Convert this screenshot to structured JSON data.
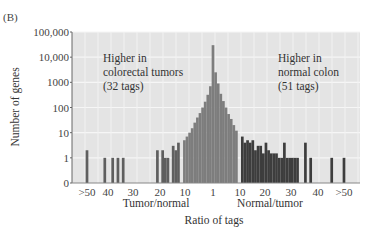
{
  "panel_label": "(B)",
  "chart_data": {
    "type": "bar",
    "title": "",
    "xlabel": "Ratio of tags",
    "ylabel": "Number of genes",
    "yscale": "log",
    "ylim": [
      0,
      100000
    ],
    "y_ticks": [
      {
        "value": 0,
        "label": "0"
      },
      {
        "value": 1,
        "label": "1"
      },
      {
        "value": 10,
        "label": "10"
      },
      {
        "value": 100,
        "label": "100"
      },
      {
        "value": 1000,
        "label": "1000"
      },
      {
        "value": 10000,
        "label": "10,000"
      },
      {
        "value": 100000,
        "label": "100,000"
      }
    ],
    "x_ticks": [
      ">50",
      "40",
      "30",
      "20",
      "10",
      "1",
      "10",
      "20",
      "30",
      "40",
      ">50"
    ],
    "x_group_labels": [
      {
        "label": "Tumor/normal",
        "side": "left"
      },
      {
        "label": "Normal/tumor",
        "side": "right"
      }
    ],
    "grid": true,
    "annotations": [
      {
        "lines": [
          "Higher  in",
          "colorectal tumors",
          "(32 tags)"
        ],
        "side": "left"
      },
      {
        "lines": [
          "Higher  in",
          "normal colon",
          "(51 tags)"
        ],
        "side": "right"
      }
    ],
    "series": [
      {
        "name": "Higher in colorectal tumors",
        "color": "#5f5f5f",
        "side": "left",
        "bars": [
          {
            "ratio": ">50",
            "value": 2
          },
          {
            "ratio": 41,
            "value": 1
          },
          {
            "ratio": 38,
            "value": 1
          },
          {
            "ratio": 36,
            "value": 1
          },
          {
            "ratio": 34,
            "value": 1
          },
          {
            "ratio": 21,
            "value": 2
          },
          {
            "ratio": 19,
            "value": 2
          },
          {
            "ratio": 18,
            "value": 1
          },
          {
            "ratio": 17,
            "value": 1
          },
          {
            "ratio": 15,
            "value": 3
          },
          {
            "ratio": 14,
            "value": 2
          },
          {
            "ratio": 13,
            "value": 4
          }
        ]
      },
      {
        "name": "Similar expression",
        "color": "#7d7d7d",
        "side": "center",
        "bars": [
          {
            "ratio": -11,
            "value": 5
          },
          {
            "ratio": -10,
            "value": 7
          },
          {
            "ratio": -9,
            "value": 10
          },
          {
            "ratio": -8,
            "value": 15
          },
          {
            "ratio": -7,
            "value": 25
          },
          {
            "ratio": -6,
            "value": 40
          },
          {
            "ratio": -5,
            "value": 60
          },
          {
            "ratio": -4,
            "value": 100
          },
          {
            "ratio": -3,
            "value": 170
          },
          {
            "ratio": -2,
            "value": 320
          },
          {
            "ratio": -1,
            "value": 700
          },
          {
            "ratio": 1,
            "value": 30000
          },
          {
            "ratio": 2,
            "value": 2500
          },
          {
            "ratio": 3,
            "value": 900
          },
          {
            "ratio": 4,
            "value": 350
          },
          {
            "ratio": 5,
            "value": 180
          },
          {
            "ratio": 6,
            "value": 100
          },
          {
            "ratio": 7,
            "value": 55
          },
          {
            "ratio": 8,
            "value": 35
          },
          {
            "ratio": 9,
            "value": 20
          },
          {
            "ratio": 10,
            "value": 12
          }
        ]
      },
      {
        "name": "Higher in normal colon",
        "color": "#3d3d3d",
        "side": "right",
        "bars": [
          {
            "ratio": 11,
            "value": 7
          },
          {
            "ratio": 12,
            "value": 4
          },
          {
            "ratio": 13,
            "value": 5
          },
          {
            "ratio": 14,
            "value": 4
          },
          {
            "ratio": 15,
            "value": 5
          },
          {
            "ratio": 16,
            "value": 2
          },
          {
            "ratio": 17,
            "value": 3
          },
          {
            "ratio": 18,
            "value": 3
          },
          {
            "ratio": 19,
            "value": 1.5
          },
          {
            "ratio": 20,
            "value": 4
          },
          {
            "ratio": 21,
            "value": 2
          },
          {
            "ratio": 22,
            "value": 1.5
          },
          {
            "ratio": 23,
            "value": 1.5
          },
          {
            "ratio": 24,
            "value": 1.5
          },
          {
            "ratio": 25,
            "value": 1
          },
          {
            "ratio": 26,
            "value": 1
          },
          {
            "ratio": 27,
            "value": 4
          },
          {
            "ratio": 28,
            "value": 1
          },
          {
            "ratio": 29,
            "value": 1
          },
          {
            "ratio": 30,
            "value": 1
          },
          {
            "ratio": 31,
            "value": 1
          },
          {
            "ratio": 32,
            "value": 1
          },
          {
            "ratio": 35,
            "value": 4
          },
          {
            "ratio": 37,
            "value": 1
          },
          {
            "ratio": 45,
            "value": 1
          },
          {
            "ratio": ">50",
            "value": 1
          }
        ]
      }
    ]
  }
}
